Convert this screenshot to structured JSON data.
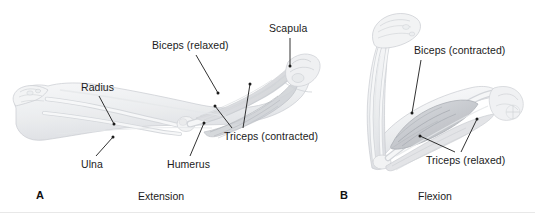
{
  "figure": {
    "background_color": "#ffffff",
    "label_color": "#1b1b1b",
    "border_color": "#e8e8e8"
  },
  "panels": [
    {
      "letter": "A",
      "caption": "Extension",
      "labels": [
        {
          "text": "Radius",
          "name": "label-radius"
        },
        {
          "text": "Ulna",
          "name": "label-ulna"
        },
        {
          "text": "Humerus",
          "name": "label-humerus"
        },
        {
          "text": "Biceps (relaxed)",
          "name": "label-biceps-relaxed"
        },
        {
          "text": "Scapula",
          "name": "label-scapula"
        },
        {
          "text": "Triceps (contracted)",
          "name": "label-triceps-contracted"
        }
      ]
    },
    {
      "letter": "B",
      "caption": "Flexion",
      "labels": [
        {
          "text": "Biceps (contracted)",
          "name": "label-biceps-contracted"
        },
        {
          "text": "Triceps (relaxed)",
          "name": "label-triceps-relaxed"
        }
      ]
    }
  ],
  "artwork": {
    "panel_a_description": "arm-extended-anatomy",
    "panel_b_description": "arm-flexed-anatomy",
    "stroke_color": "#b9bcc2",
    "muscle_fill": "#d6d8dc",
    "bone_fill": "#f2f3f4"
  }
}
